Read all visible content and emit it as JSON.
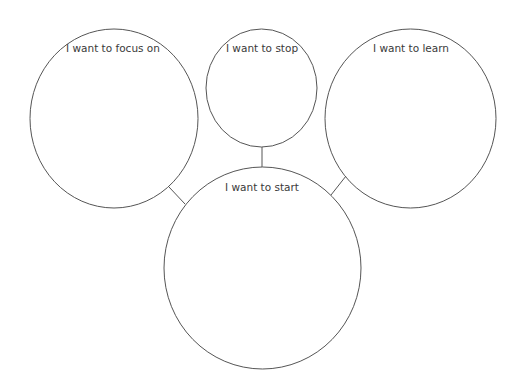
{
  "diagram": {
    "type": "bubble-map",
    "stroke_color": "#555555",
    "text_color": "#3a3a3a",
    "bubbles": [
      {
        "id": "focus",
        "label": "I want to focus on"
      },
      {
        "id": "stop",
        "label": "I want to stop"
      },
      {
        "id": "learn",
        "label": "I want to learn"
      },
      {
        "id": "start",
        "label": "I want to start"
      }
    ],
    "connections": [
      {
        "from": "focus",
        "to": "start"
      },
      {
        "from": "stop",
        "to": "start"
      },
      {
        "from": "learn",
        "to": "start"
      }
    ]
  }
}
